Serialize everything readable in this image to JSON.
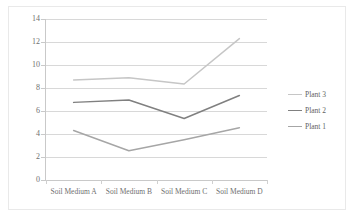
{
  "chart_data": {
    "type": "line",
    "title": "",
    "xlabel": "",
    "ylabel": "",
    "categories": [
      "Soil Medium A",
      "Soil Medium B",
      "Soil Medium C",
      "Soil Medium D"
    ],
    "series": [
      {
        "name": "Plant 1",
        "values": [
          4.3,
          2.55,
          3.5,
          4.55
        ],
        "color": "#a6a6a6"
      },
      {
        "name": "Plant 2",
        "values": [
          6.75,
          6.95,
          5.35,
          7.35
        ],
        "color": "#808080"
      },
      {
        "name": "Plant 3",
        "values": [
          8.7,
          8.9,
          8.35,
          12.3
        ],
        "color": "#c6c6c6"
      }
    ],
    "legend_order": [
      "Plant 3",
      "Plant 2",
      "Plant 1"
    ],
    "legend_position": "right",
    "ylim": [
      0,
      14
    ],
    "yticks": [
      0,
      2,
      4,
      6,
      8,
      10,
      12,
      14
    ],
    "ytick_labels": [
      "0",
      "2",
      "4",
      "6",
      "8",
      "10",
      "12",
      "14"
    ],
    "grid": true,
    "grid_axis": "y"
  },
  "legend": {
    "items": [
      {
        "label": "Plant 3",
        "color": "#c6c6c6"
      },
      {
        "label": "Plant 2",
        "color": "#808080"
      },
      {
        "label": "Plant 1",
        "color": "#a6a6a6"
      }
    ]
  }
}
